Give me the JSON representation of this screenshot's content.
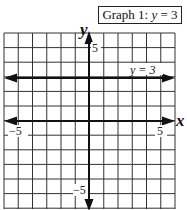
{
  "chart_data": {
    "type": "line",
    "title": "Graph 1: y = 3",
    "title_prefix": "Graph 1: ",
    "title_equation_var": "y",
    "title_equation_rest": " = 3",
    "xlabel": "x",
    "ylabel": "y",
    "xlim": [
      -6,
      6
    ],
    "ylim": [
      -6,
      6
    ],
    "grid": true,
    "x_ticks_labeled": [
      {
        "value": -5,
        "label": "−5"
      },
      {
        "value": 5,
        "label": "5"
      }
    ],
    "y_ticks_labeled": [
      {
        "value": 5,
        "label": "5"
      },
      {
        "value": -5,
        "label": "−5"
      }
    ],
    "series": [
      {
        "name": "y = 3",
        "equation": "y = 3",
        "x": [
          -6,
          6
        ],
        "y": [
          3,
          3
        ],
        "arrows": "both"
      }
    ],
    "annotations": [
      {
        "text": "y = 3",
        "x": 4,
        "y": 3.3
      }
    ]
  },
  "labels": {
    "x_axis": "x",
    "y_axis": "y",
    "x_neg5": "−5",
    "x_pos5": "5",
    "y_pos5": "5",
    "y_neg5": "−5",
    "line_label": "y = 3"
  }
}
